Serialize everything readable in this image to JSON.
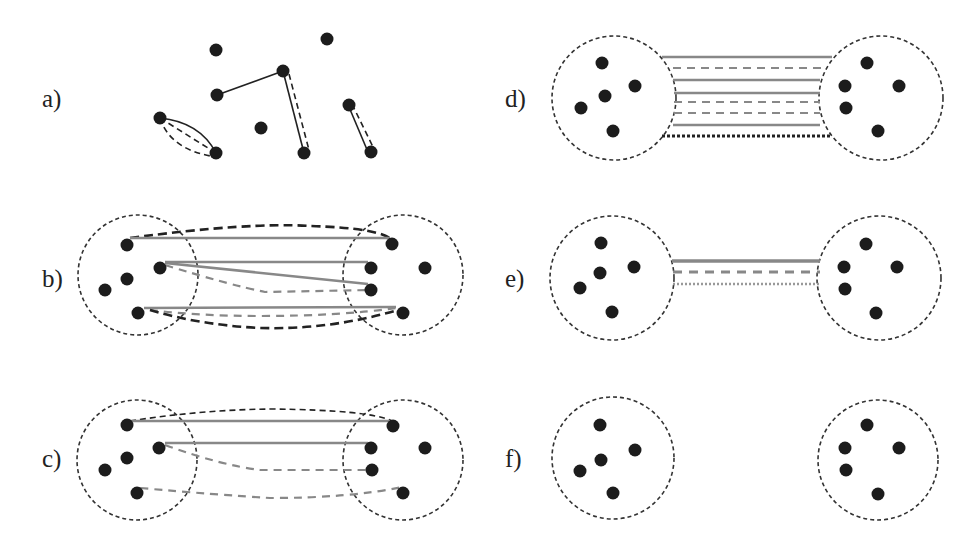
{
  "figure": {
    "panels": [
      {
        "id": "a",
        "label": "a)",
        "description": "Individual nodes with pairwise edges (solid and dashed)"
      },
      {
        "id": "b",
        "label": "b)",
        "description": "Two clusters with many inter-cluster edges of different styles"
      },
      {
        "id": "c",
        "label": "c)",
        "description": "Two clusters with fewer inter-cluster edges"
      },
      {
        "id": "d",
        "label": "d)",
        "description": "Edges bundled between two clusters (8 parallel lines)"
      },
      {
        "id": "e",
        "label": "e)",
        "description": "Aggregated edge bundle (3 parallel lines)"
      },
      {
        "id": "f",
        "label": "f)",
        "description": "Two clusters without edges"
      }
    ],
    "colors": {
      "node": "#1c1c1c",
      "edge_dark": "#222222",
      "edge_gray": "#888888",
      "cluster_outline": "#333333",
      "background": "#ffffff"
    },
    "node_radius": 6.5
  }
}
